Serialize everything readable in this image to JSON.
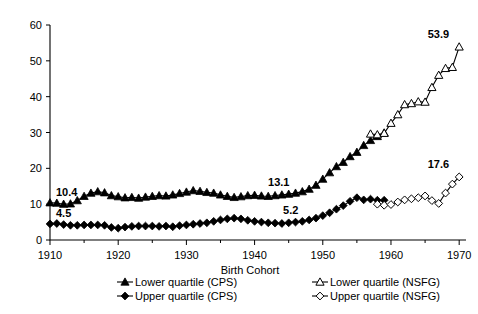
{
  "chart_data": {
    "type": "line",
    "title": "",
    "xlabel": "Birth Cohort",
    "ylabel": "",
    "xlim": [
      1910,
      1971
    ],
    "ylim": [
      0,
      60
    ],
    "xticks": [
      1910,
      1920,
      1930,
      1940,
      1950,
      1960,
      1970
    ],
    "xtick_labels": [
      "1910",
      "1920",
      "1930",
      "1940",
      "1950",
      "1960",
      "1970"
    ],
    "minor_xticks": [
      1915,
      1925,
      1935,
      1945,
      1955,
      1965
    ],
    "yticks": [
      0,
      10,
      20,
      30,
      40,
      50,
      60
    ],
    "ytick_labels": [
      "0",
      "10",
      "20",
      "30",
      "40",
      "50",
      "60"
    ],
    "grid": false,
    "legend_position": "below-axis",
    "series": [
      {
        "name": "Lower quartile (CPS)",
        "marker": "filled-triangle",
        "x": [
          1910,
          1911,
          1912,
          1913,
          1914,
          1915,
          1916,
          1917,
          1918,
          1919,
          1920,
          1921,
          1922,
          1923,
          1924,
          1925,
          1926,
          1927,
          1928,
          1929,
          1930,
          1931,
          1932,
          1933,
          1934,
          1935,
          1936,
          1937,
          1938,
          1939,
          1940,
          1941,
          1942,
          1943,
          1944,
          1945,
          1946,
          1947,
          1948,
          1949,
          1950,
          1951,
          1952,
          1953,
          1954,
          1955,
          1956,
          1957,
          1958,
          1959
        ],
        "values": [
          10.4,
          10.3,
          10.0,
          10.1,
          11.0,
          12.2,
          13.1,
          13.5,
          13.2,
          12.4,
          12.1,
          11.8,
          11.9,
          11.7,
          12.0,
          12.2,
          12.4,
          12.3,
          12.6,
          13.0,
          13.4,
          13.8,
          13.6,
          13.3,
          13.1,
          12.6,
          12.2,
          11.9,
          12.1,
          12.4,
          12.5,
          12.3,
          12.2,
          12.4,
          12.6,
          12.8,
          13.1,
          13.5,
          14.2,
          15.3,
          17.0,
          18.8,
          20.5,
          21.7,
          23.3,
          24.5,
          26.4,
          27.8,
          28.9,
          29.9
        ]
      },
      {
        "name": "Upper quartile (CPS)",
        "marker": "filled-diamond",
        "x": [
          1910,
          1911,
          1912,
          1913,
          1914,
          1915,
          1916,
          1917,
          1918,
          1919,
          1920,
          1921,
          1922,
          1923,
          1924,
          1925,
          1926,
          1927,
          1928,
          1929,
          1930,
          1931,
          1932,
          1933,
          1934,
          1935,
          1936,
          1937,
          1938,
          1939,
          1940,
          1941,
          1942,
          1943,
          1944,
          1945,
          1946,
          1947,
          1948,
          1949,
          1950,
          1951,
          1952,
          1953,
          1954,
          1955,
          1956,
          1957,
          1958,
          1959
        ],
        "values": [
          4.5,
          4.6,
          4.3,
          4.1,
          4.1,
          4.2,
          4.2,
          4.2,
          4.1,
          3.5,
          3.3,
          3.6,
          3.8,
          3.9,
          3.9,
          3.9,
          3.8,
          3.9,
          3.7,
          4.0,
          4.2,
          4.4,
          4.6,
          4.8,
          5.2,
          5.6,
          5.9,
          6.1,
          5.9,
          5.5,
          5.2,
          5.0,
          4.8,
          4.7,
          4.6,
          4.8,
          5.0,
          5.2,
          5.6,
          6.1,
          6.8,
          7.6,
          8.6,
          9.6,
          10.8,
          11.8,
          11.2,
          11.4,
          11.1,
          11.1
        ]
      },
      {
        "name": "Lower quartile (NSFG)",
        "marker": "open-triangle",
        "x": [
          1957,
          1958,
          1959,
          1960,
          1961,
          1962,
          1963,
          1964,
          1965,
          1966,
          1967,
          1968,
          1969,
          1970
        ],
        "values": [
          29.6,
          29.4,
          29.8,
          32.6,
          35.0,
          37.8,
          38.1,
          38.6,
          38.5,
          42.6,
          46.0,
          47.9,
          48.2,
          53.9
        ]
      },
      {
        "name": "Upper quartile (NSFG)",
        "marker": "open-diamond",
        "x": [
          1958,
          1959,
          1960,
          1961,
          1962,
          1963,
          1964,
          1965,
          1966,
          1967,
          1968,
          1969,
          1970
        ],
        "values": [
          10.0,
          9.7,
          9.9,
          10.6,
          11.2,
          11.5,
          11.8,
          12.3,
          11.0,
          10.2,
          13.1,
          15.6,
          17.6
        ]
      }
    ],
    "annotations": [
      {
        "text": "10.4",
        "x": 1910,
        "y": 10.4,
        "dx": 6,
        "dy": -7
      },
      {
        "text": "4.5",
        "x": 1910,
        "y": 4.5,
        "dx": 6,
        "dy": -7
      },
      {
        "text": "13.1",
        "x": 1946,
        "y": 13.1,
        "dx": -6,
        "dy": -7
      },
      {
        "text": "5.2",
        "x": 1947,
        "y": 5.2,
        "dx": -4,
        "dy": -7
      },
      {
        "text": "53.9",
        "x": 1970,
        "y": 53.9,
        "dx": -10,
        "dy": -9
      },
      {
        "text": "17.6",
        "x": 1970,
        "y": 17.6,
        "dx": -10,
        "dy": -9
      }
    ]
  },
  "legend": {
    "items": [
      {
        "label": "Lower quartile (CPS)",
        "marker": "filled-triangle"
      },
      {
        "label": "Upper quartile (CPS)",
        "marker": "filled-diamond"
      },
      {
        "label": "Lower quartile (NSFG)",
        "marker": "open-triangle"
      },
      {
        "label": "Upper quartile (NSFG)",
        "marker": "open-diamond"
      }
    ]
  },
  "colors": {
    "ink": "#000000",
    "background": "#ffffff"
  }
}
